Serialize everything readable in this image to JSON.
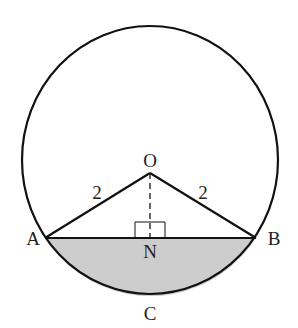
{
  "diagram": {
    "type": "geometry-circle-segment",
    "colors": {
      "stroke": "#111111",
      "shade": "#cdcdcd",
      "text": "#222222",
      "background": "#ffffff"
    },
    "circle": {
      "cx": 150,
      "cy": 160,
      "rx": 128,
      "ry": 134
    },
    "points": {
      "O": {
        "label": "O",
        "x": 150,
        "y": 173
      },
      "A": {
        "label": "A",
        "x": 45,
        "y": 238
      },
      "B": {
        "label": "B",
        "x": 256,
        "y": 238
      },
      "N": {
        "label": "N",
        "x": 150,
        "y": 238
      },
      "C": {
        "label": "C",
        "x": 150,
        "y": 294
      }
    },
    "segments": [
      {
        "from": "O",
        "to": "A",
        "length_label": "2"
      },
      {
        "from": "O",
        "to": "B",
        "length_label": "2"
      },
      {
        "from": "A",
        "to": "B"
      },
      {
        "from": "O",
        "to": "N",
        "style": "dashed"
      }
    ],
    "right_angle_at": "N",
    "shaded_region": "minor segment ACB",
    "labels": {
      "O": "O",
      "A": "A",
      "B": "B",
      "N": "N",
      "C": "C",
      "OA_length": "2",
      "OB_length": "2"
    }
  }
}
